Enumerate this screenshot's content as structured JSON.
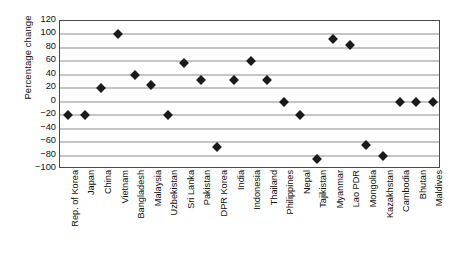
{
  "chart_data": {
    "type": "scatter",
    "title": "",
    "xlabel": "",
    "ylabel": "Percentage change",
    "ylim": [
      -100,
      120
    ],
    "ytick_step": 20,
    "yticks": [
      120,
      100,
      80,
      60,
      40,
      20,
      0,
      -20,
      -40,
      -60,
      -80,
      -100
    ],
    "ytick_labels": [
      "120",
      "100",
      "80",
      "60",
      "40",
      "20",
      "0",
      "−20",
      "−40",
      "−60",
      "−80",
      "−100"
    ],
    "grid": true,
    "legend": "none",
    "marker": "diamond",
    "marker_color": "#1a1a1a",
    "categories": [
      "Rep. of Korea",
      "Japan",
      "China",
      "Vietnam",
      "Bangladesh",
      "Malaysia",
      "Uzbekistan",
      "Sri Lanka",
      "Pakistan",
      "DPR Korea",
      "India",
      "Indonesia",
      "Thailand",
      "Philippines",
      "Nepal",
      "Tajikistan",
      "Myanmar",
      "Lao PDR",
      "Mongolia",
      "Kazakhstan",
      "Cambodia",
      "Bhutan",
      "Maldives"
    ],
    "values": [
      -20,
      -20,
      20,
      100,
      40,
      25,
      -20,
      57,
      32,
      -68,
      33,
      60,
      33,
      0,
      -20,
      -85,
      93,
      85,
      -65,
      -80,
      0,
      0,
      0
    ]
  }
}
